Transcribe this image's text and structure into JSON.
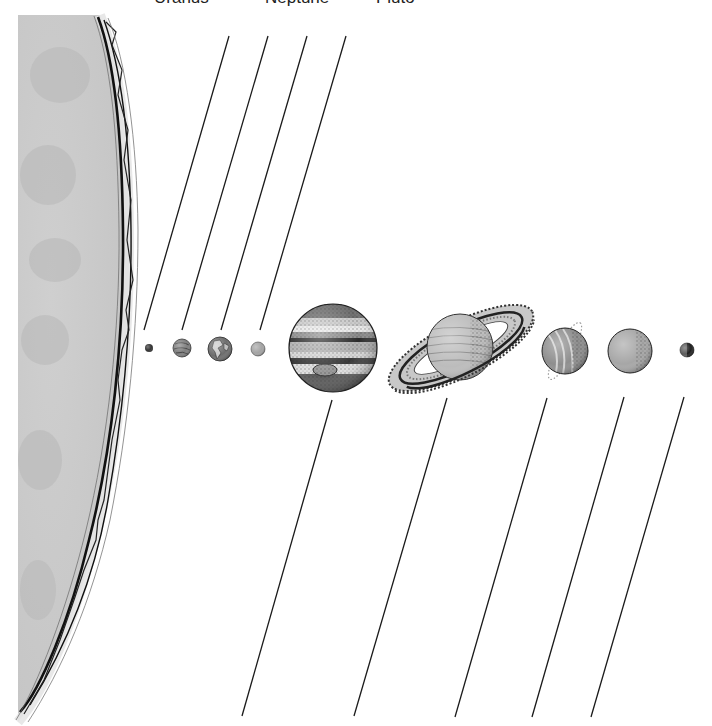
{
  "diagram": {
    "type": "solar-system-labeling-worksheet",
    "background": "#ffffff",
    "line_color": "#1a1a1a",
    "top_labels": [
      {
        "text": "Uranus",
        "x": 154
      },
      {
        "text": "Neptune",
        "x": 265
      },
      {
        "text": "Pluto",
        "x": 376
      }
    ],
    "sun": {
      "name": "Sun",
      "fill": "#c9c9c9",
      "edge_color": "#111111"
    },
    "planets": [
      {
        "name": "Mercury",
        "cx": 149,
        "cy": 348,
        "r": 4,
        "fill": "#3a3a3a"
      },
      {
        "name": "Venus",
        "cx": 182,
        "cy": 348,
        "r": 9,
        "fill": "#7a7a7a"
      },
      {
        "name": "Earth",
        "cx": 220,
        "cy": 349,
        "r": 12,
        "fill": "#6a6a6a"
      },
      {
        "name": "Mars",
        "cx": 258,
        "cy": 349,
        "r": 7,
        "fill": "#9a9a9a"
      },
      {
        "name": "Jupiter",
        "cx": 333,
        "cy": 348,
        "r": 44,
        "fill": "#8c8c8c"
      },
      {
        "name": "Saturn",
        "cx": 460,
        "cy": 347,
        "r": 33,
        "fill": "#b5b5b5"
      },
      {
        "name": "Uranus",
        "cx": 565,
        "cy": 351,
        "r": 23,
        "fill": "#8a8a8a"
      },
      {
        "name": "Neptune",
        "cx": 630,
        "cy": 351,
        "r": 22,
        "fill": "#a0a0a0"
      },
      {
        "name": "Pluto",
        "cx": 687,
        "cy": 350,
        "r": 7,
        "fill": "#5a5a5a"
      }
    ],
    "upper_label_lines": [
      {
        "for": "Mercury",
        "x1": 229,
        "y1": 36,
        "x2": 144,
        "y2": 330
      },
      {
        "for": "Venus",
        "x1": 268,
        "y1": 36,
        "x2": 182,
        "y2": 330
      },
      {
        "for": "Earth",
        "x1": 307,
        "y1": 36,
        "x2": 221,
        "y2": 330
      },
      {
        "for": "Mars",
        "x1": 346,
        "y1": 36,
        "x2": 260,
        "y2": 330
      }
    ],
    "lower_label_lines": [
      {
        "for": "Jupiter",
        "x1": 332,
        "y1": 400,
        "x2": 242,
        "y2": 716
      },
      {
        "for": "Saturn",
        "x1": 447,
        "y1": 398,
        "x2": 354,
        "y2": 716
      },
      {
        "for": "Uranus",
        "x1": 547,
        "y1": 398,
        "x2": 455,
        "y2": 717
      },
      {
        "for": "Neptune",
        "x1": 624,
        "y1": 397,
        "x2": 532,
        "y2": 717
      },
      {
        "for": "Pluto",
        "x1": 684,
        "y1": 397,
        "x2": 591,
        "y2": 717
      }
    ]
  }
}
